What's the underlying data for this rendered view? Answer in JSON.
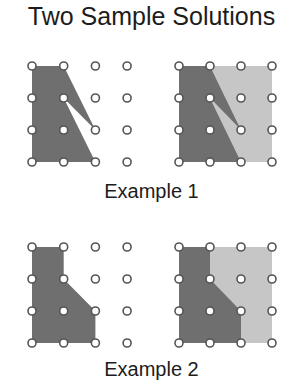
{
  "title": "Two Sample Solutions",
  "colors": {
    "dark_region": "#6f6f6f",
    "light_region": "#c6c6c6",
    "dot_stroke": "#555555",
    "dot_fill": "#ffffff",
    "text": "#1c1c1c"
  },
  "examples": [
    {
      "caption": "Example 1",
      "left_grid": {
        "origin": [
          32,
          66
        ],
        "spacing": [
          31.7,
          32
        ],
        "cols": 4,
        "rows": 4
      },
      "right_grid": {
        "origin": [
          179,
          66
        ],
        "spacing": [
          31,
          32
        ],
        "cols": 4,
        "rows": 4
      },
      "dark_polygon_grid": [
        [
          0,
          0
        ],
        [
          1,
          0
        ],
        [
          2,
          2
        ],
        [
          1,
          1
        ],
        [
          2,
          3
        ],
        [
          0,
          3
        ]
      ],
      "light_polygon_grid": [
        [
          1,
          0
        ],
        [
          3,
          0
        ],
        [
          3,
          3
        ],
        [
          2,
          3
        ],
        [
          1,
          1
        ],
        [
          2,
          2
        ]
      ]
    },
    {
      "caption": "Example 2",
      "left_grid": {
        "origin": [
          32,
          247
        ],
        "spacing": [
          31.7,
          32
        ],
        "cols": 4,
        "rows": 4
      },
      "right_grid": {
        "origin": [
          179,
          247
        ],
        "spacing": [
          31,
          32
        ],
        "cols": 4,
        "rows": 4
      },
      "dark_polygon_grid": [
        [
          0,
          0
        ],
        [
          1,
          0
        ],
        [
          1,
          1
        ],
        [
          2,
          2
        ],
        [
          2,
          3
        ],
        [
          0,
          3
        ]
      ],
      "light_polygon_grid": [
        [
          1,
          0
        ],
        [
          3,
          0
        ],
        [
          3,
          3
        ],
        [
          2,
          3
        ],
        [
          2,
          2
        ],
        [
          1,
          1
        ]
      ]
    }
  ]
}
